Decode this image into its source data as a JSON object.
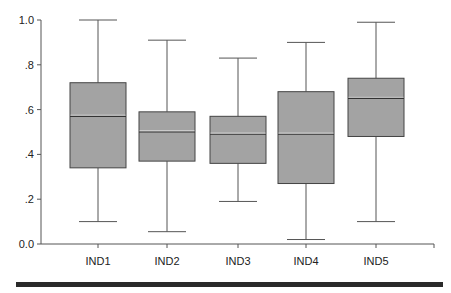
{
  "chart_data": {
    "type": "boxplot",
    "title": "",
    "xlabel": "",
    "ylabel": "",
    "ylim": [
      0,
      1
    ],
    "yticks": [
      {
        "value": 0.0,
        "label": "0.0"
      },
      {
        "value": 0.2,
        "label": ".2"
      },
      {
        "value": 0.4,
        "label": ".4"
      },
      {
        "value": 0.6,
        "label": ".6"
      },
      {
        "value": 0.8,
        "label": ".8"
      },
      {
        "value": 1.0,
        "label": "1.0"
      }
    ],
    "grid": false,
    "categories": [
      "IND1",
      "IND2",
      "IND3",
      "IND4",
      "IND5"
    ],
    "series": [
      {
        "name": "IND1",
        "min": 0.1,
        "q1": 0.34,
        "median": 0.57,
        "q3": 0.72,
        "max": 1.0
      },
      {
        "name": "IND2",
        "min": 0.055,
        "q1": 0.37,
        "median": 0.5,
        "q3": 0.59,
        "max": 0.91
      },
      {
        "name": "IND3",
        "min": 0.19,
        "q1": 0.36,
        "median": 0.49,
        "q3": 0.57,
        "max": 0.83
      },
      {
        "name": "IND4",
        "min": 0.02,
        "q1": 0.27,
        "median": 0.49,
        "q3": 0.68,
        "max": 0.9
      },
      {
        "name": "IND5",
        "min": 0.1,
        "q1": 0.48,
        "median": 0.65,
        "q3": 0.74,
        "max": 0.99
      }
    ],
    "colors": {
      "box_fill": "#a3a3a3",
      "box_stroke": "#444444",
      "whisker": "#555555",
      "bottom_bar": "#2a2a2a"
    }
  }
}
